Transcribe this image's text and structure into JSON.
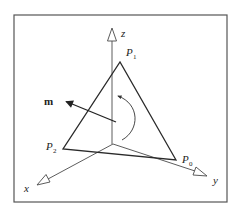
{
  "figure": {
    "frame": {
      "x": 14,
      "y": 15,
      "width": 213,
      "height": 187,
      "color": "#555555"
    },
    "colors": {
      "line": "#2a2a2a",
      "axis": "#4a4a4a",
      "background": "#ffffff"
    },
    "axes": {
      "origin": [
        113,
        144
      ],
      "z": {
        "label": "z",
        "tip": [
          112,
          28
        ]
      },
      "x": {
        "label": "x",
        "tip": [
          37,
          185
        ]
      },
      "y": {
        "label": "y",
        "tip": [
          207,
          176
        ]
      }
    },
    "triangle": {
      "P0": {
        "label": "P",
        "sub": "0",
        "point": [
          176,
          160
        ]
      },
      "P1": {
        "label": "P",
        "sub": "1",
        "point": [
          120,
          62
        ]
      },
      "P2": {
        "label": "P",
        "sub": "2",
        "point": [
          63,
          149
        ]
      }
    },
    "normal": {
      "label": "m",
      "from": [
        116,
        122
      ],
      "to": [
        65,
        101
      ]
    },
    "rotation_arrow": {
      "direction": "counter-clockwise"
    }
  }
}
